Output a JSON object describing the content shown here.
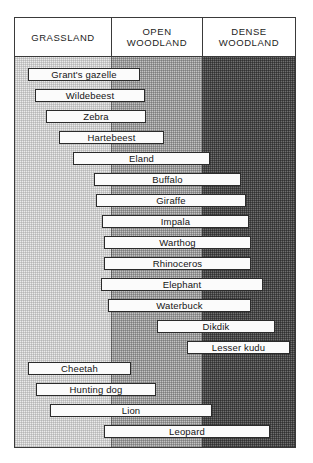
{
  "figure": {
    "type": "range-chart",
    "title": "",
    "background_color": "#ffffff"
  },
  "chart_data": {
    "type": "bar",
    "orientation": "horizontal",
    "title": "",
    "xlabel": "",
    "ylabel": "",
    "axis_categories": [
      "GRASSLAND",
      "OPEN WOODLAND",
      "DENSE WOODLAND"
    ],
    "axis_boundaries_px": [
      14,
      110,
      201,
      296
    ],
    "categories": [
      "Grant's gazelle",
      "Wildebeest",
      "Zebra",
      "Hartebeest",
      "Eland",
      "Buffalo",
      "Giraffe",
      "Impala",
      "Warthog",
      "Rhinoceros",
      "Elephant",
      "Waterbuck",
      "Dikdik",
      "Lesser kudu",
      "Cheetah",
      "Hunting dog",
      "Lion",
      "Leopard"
    ],
    "bars": [
      {
        "label": "Grant's gazelle",
        "start": 27,
        "end": 139,
        "row": 0,
        "group": "herbivore"
      },
      {
        "label": "Wildebeest",
        "start": 34,
        "end": 144,
        "row": 1,
        "group": "herbivore"
      },
      {
        "label": "Zebra",
        "start": 45,
        "end": 145,
        "row": 2,
        "group": "herbivore"
      },
      {
        "label": "Hartebeest",
        "start": 58,
        "end": 163,
        "row": 3,
        "group": "herbivore"
      },
      {
        "label": "Eland",
        "start": 72,
        "end": 209,
        "row": 4,
        "group": "herbivore"
      },
      {
        "label": "Buffalo",
        "start": 93,
        "end": 240,
        "row": 5,
        "group": "herbivore"
      },
      {
        "label": "Giraffe",
        "start": 95,
        "end": 245,
        "row": 6,
        "group": "herbivore"
      },
      {
        "label": "Impala",
        "start": 101,
        "end": 248,
        "row": 7,
        "group": "herbivore"
      },
      {
        "label": "Warthog",
        "start": 103,
        "end": 250,
        "row": 8,
        "group": "herbivore"
      },
      {
        "label": "Rhinoceros",
        "start": 103,
        "end": 250,
        "row": 9,
        "group": "herbivore"
      },
      {
        "label": "Elephant",
        "start": 100,
        "end": 262,
        "row": 10,
        "group": "herbivore"
      },
      {
        "label": "Waterbuck",
        "start": 107,
        "end": 250,
        "row": 11,
        "group": "herbivore"
      },
      {
        "label": "Dikdik",
        "start": 156,
        "end": 274,
        "row": 12,
        "group": "herbivore"
      },
      {
        "label": "Lesser kudu",
        "start": 186,
        "end": 289,
        "row": 13,
        "group": "herbivore"
      },
      {
        "label": "Cheetah",
        "start": 27,
        "end": 130,
        "row": 14,
        "group": "predator"
      },
      {
        "label": "Hunting dog",
        "start": 35,
        "end": 155,
        "row": 15,
        "group": "predator"
      },
      {
        "label": "Lion",
        "start": 49,
        "end": 211,
        "row": 16,
        "group": "predator"
      },
      {
        "label": "Leopard",
        "start": 103,
        "end": 269,
        "row": 17,
        "group": "predator"
      }
    ],
    "legend": [],
    "grid": false
  },
  "header": {
    "columns": [
      {
        "label": "GRASSLAND",
        "name": "grassland"
      },
      {
        "label": "OPEN\nWOODLAND",
        "name": "open-woodland"
      },
      {
        "label": "DENSE\nWOODLAND",
        "name": "dense-woodland"
      }
    ]
  },
  "bands": [
    {
      "name": "grassland",
      "left": 0,
      "width": 96,
      "shade": "light",
      "color": "#ebebeb"
    },
    {
      "name": "open-woodland",
      "left": 96,
      "width": 91,
      "shade": "medium",
      "color": "#c3c3c3"
    },
    {
      "name": "dense-woodland",
      "left": 187,
      "width": 93,
      "shade": "dark",
      "color": "#6f6f6f"
    }
  ]
}
